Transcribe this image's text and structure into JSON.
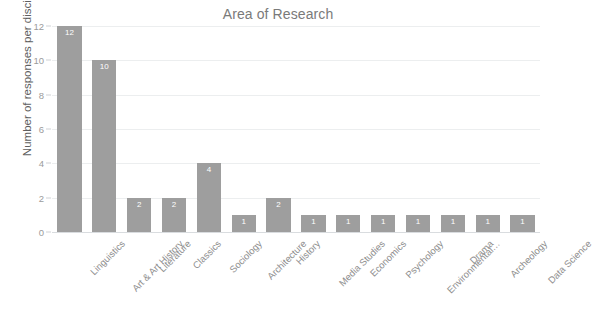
{
  "chart_data": {
    "type": "bar",
    "title": "Area of Research",
    "xlabel": "",
    "ylabel": "Number of responses per discipline",
    "ylim": [
      0,
      12
    ],
    "yticks": [
      0,
      2,
      4,
      6,
      8,
      10,
      12
    ],
    "grid": true,
    "legend": false,
    "bar_color": "#9e9e9e",
    "value_label_color": "#ffffff",
    "categories": [
      "Linguistics",
      "Art & Art History",
      "Literature",
      "Classics",
      "Sociology",
      "Architecture",
      "History",
      "Media Studies",
      "Economics",
      "Psychology",
      "Environmental…",
      "Drama",
      "Archeology",
      "Data Science"
    ],
    "values": [
      12,
      10,
      2,
      2,
      4,
      1,
      2,
      1,
      1,
      1,
      1,
      1,
      1,
      1
    ]
  }
}
